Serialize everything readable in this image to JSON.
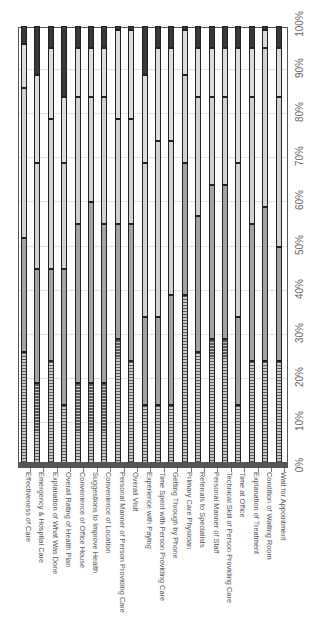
{
  "chart_data": {
    "type": "bar",
    "stacked": true,
    "orientation": "rotated-90",
    "title": "",
    "xlabel": "",
    "ylabel": "",
    "ylim": [
      0,
      100
    ],
    "y_ticks": [
      "0%",
      "10%",
      "20%",
      "30%",
      "40%",
      "50%",
      "60%",
      "70%",
      "80%",
      "90%",
      "100%"
    ],
    "grid": true,
    "legend": null,
    "categories": [
      "Effectiveness of Care",
      "Emergency & Hospital Care",
      "Explanation of What Was Done",
      "Overall Rating of Health Plan",
      "Convenience of Office House",
      "Suggestions to Improve Health",
      "Convenience of Location",
      "Personal Manner of Person Providing Care",
      "Overall Visit",
      "Experience with Paying",
      "Time Spent with Person Providing Care",
      "Getting Through by Phone",
      "Primary Care Physician",
      "Referrals to Specialists",
      "Personal Manner of Staff",
      "Technical Skill of Person Providing Care",
      "Time at Office",
      "Explanation of Treatment",
      "Condition of Waiting Room",
      "Wait for Appointment"
    ],
    "series": [
      {
        "name": "Segment 1 (base, dark)",
        "pattern": "dark",
        "values": [
          1,
          1,
          1,
          1,
          1,
          1,
          1,
          1,
          1,
          1,
          1,
          1,
          1,
          1,
          1,
          1,
          1,
          1,
          1,
          1
        ]
      },
      {
        "name": "Segment 2 (hatched)",
        "pattern": "hatch",
        "values": [
          25,
          18,
          23,
          13,
          18,
          18,
          18,
          28,
          23,
          13,
          13,
          13,
          38,
          25,
          28,
          28,
          13,
          23,
          23,
          23
        ]
      },
      {
        "name": "Segment 3 (medium gray)",
        "pattern": "mid",
        "values": [
          26,
          26,
          21,
          31,
          36,
          41,
          36,
          26,
          31,
          20,
          20,
          25,
          30,
          31,
          35,
          35,
          20,
          31,
          35,
          26
        ]
      },
      {
        "name": "Segment 4 (dotted)",
        "pattern": "dot",
        "values": [
          34,
          24,
          34,
          24,
          29,
          24,
          29,
          24,
          24,
          35,
          40,
          35,
          20,
          27,
          20,
          20,
          35,
          29,
          36,
          34
        ]
      },
      {
        "name": "Segment 5 (light gray)",
        "pattern": "light",
        "values": [
          10,
          20,
          16,
          15,
          11,
          11,
          11,
          20,
          20,
          20,
          21,
          21,
          10,
          11,
          11,
          11,
          26,
          11,
          4,
          11
        ]
      },
      {
        "name": "Segment 6 (dark top)",
        "pattern": "dark",
        "values": [
          4,
          11,
          5,
          16,
          5,
          5,
          5,
          1,
          1,
          11,
          5,
          5,
          1,
          5,
          5,
          5,
          5,
          5,
          1,
          5
        ]
      }
    ]
  },
  "axis": {
    "ticks": [
      "0%",
      "10%",
      "20%",
      "30%",
      "40%",
      "50%",
      "60%",
      "70%",
      "80%",
      "90%",
      "100%"
    ]
  }
}
